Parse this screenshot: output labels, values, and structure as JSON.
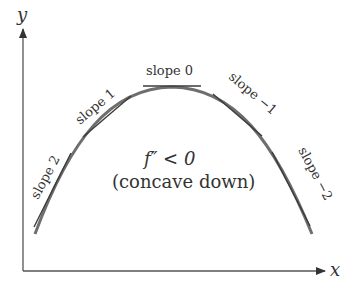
{
  "axes": {
    "x_label": "x",
    "y_label": "y"
  },
  "tangents": [
    {
      "label": "slope 2"
    },
    {
      "label": "slope 1"
    },
    {
      "label": "slope 0"
    },
    {
      "label": "slope −1"
    },
    {
      "label": "slope −2"
    }
  ],
  "annotation": {
    "line1": "f″ < 0",
    "line2": "(concave down)"
  },
  "colors": {
    "curve": "#6e6e6e",
    "tangent": "#3a3a3a",
    "axis": "#555555",
    "text": "#333333"
  }
}
